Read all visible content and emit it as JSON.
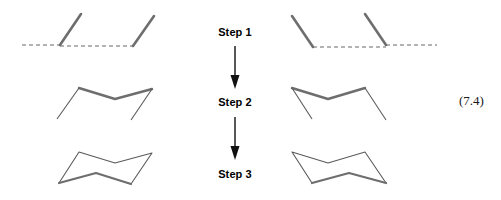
{
  "figure": {
    "equation_number": "(7.4)",
    "background_color": "#ffffff",
    "line_color_solid": "#6e6e6e",
    "line_color_thin": "#5a5a5a",
    "line_color_dashed": "#9a9a9a",
    "arrow_color": "#111111",
    "label_color": "#000000"
  },
  "steps": [
    {
      "label": "Step 1",
      "name": "step-1"
    },
    {
      "label": "Step 2",
      "name": "step-2"
    },
    {
      "label": "Step 3",
      "name": "step-3"
    }
  ],
  "arrows": [
    {
      "name": "arrow-step1-to-step2",
      "direction": "down"
    },
    {
      "name": "arrow-step2-to-step3",
      "direction": "down"
    }
  ],
  "diagrams": {
    "step1_left": {
      "title": "Step 1 left drawing",
      "dashed_baselines": [
        {
          "x1": 22,
          "y1": 45,
          "x2": 60,
          "y2": 45
        },
        {
          "x1": 60,
          "y1": 46,
          "x2": 133,
          "y2": 46
        }
      ],
      "solid_lines": [
        {
          "x1": 60,
          "y1": 45,
          "x2": 81,
          "y2": 14
        },
        {
          "x1": 133,
          "y1": 46,
          "x2": 154,
          "y2": 16
        }
      ]
    },
    "step1_right": {
      "title": "Step 1 right drawing",
      "dashed_baselines": [
        {
          "x1": 313,
          "y1": 47,
          "x2": 386,
          "y2": 47
        },
        {
          "x1": 386,
          "y1": 45,
          "x2": 437,
          "y2": 45
        }
      ],
      "solid_lines": [
        {
          "x1": 292,
          "y1": 16,
          "x2": 313,
          "y2": 47
        },
        {
          "x1": 365,
          "y1": 14,
          "x2": 386,
          "y2": 45
        }
      ]
    },
    "step2_left": {
      "title": "Step 2 left drawing",
      "thick_path": "M 79,88 L 115,99 L 152,89",
      "thin_lines": [
        {
          "x1": 79,
          "y1": 88,
          "x2": 57,
          "y2": 119
        },
        {
          "x1": 152,
          "y1": 89,
          "x2": 131,
          "y2": 120
        }
      ]
    },
    "step2_right": {
      "title": "Step 2 right drawing",
      "thick_path": "M 292,88 L 328,99 L 365,88",
      "thin_lines": [
        {
          "x1": 292,
          "y1": 88,
          "x2": 312,
          "y2": 119
        },
        {
          "x1": 365,
          "y1": 88,
          "x2": 386,
          "y2": 120
        }
      ]
    },
    "step3_left": {
      "title": "Step 3 left chair conformation",
      "thin_path": "M 59,183 L 79,152 L 115,163 L 152,153 L 131,184",
      "thick_path": "M 59,183 L 96,173 L 131,184"
    },
    "step3_right": {
      "title": "Step 3 right chair conformation",
      "thin_path": "M 312,183 L 292,152 L 328,163 L 365,152 L 386,183",
      "thick_path": "M 312,183 L 349,173 L 386,183"
    }
  }
}
